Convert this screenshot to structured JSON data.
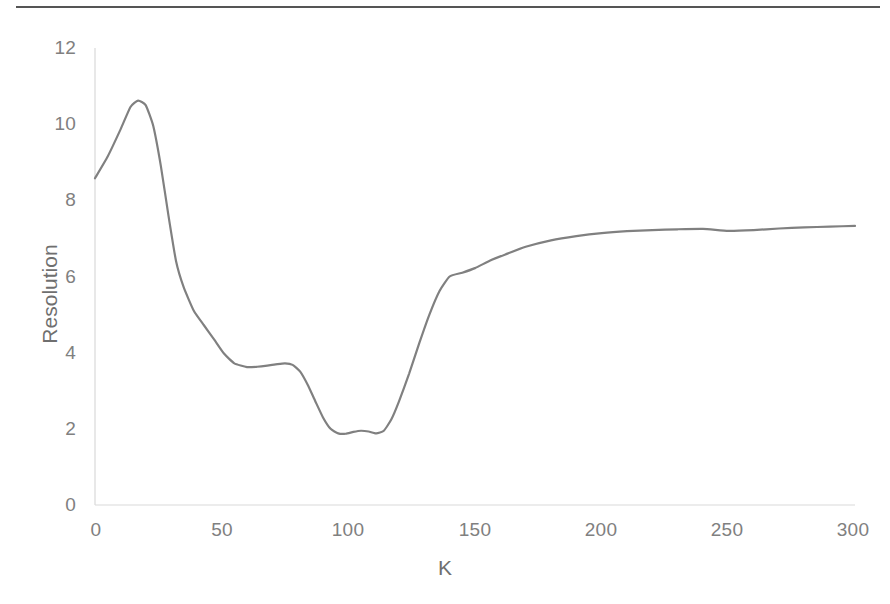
{
  "figure": {
    "background_color": "#ffffff",
    "top_rule_color": "#555555"
  },
  "chart_data": {
    "type": "line",
    "title": "",
    "subtitle": "",
    "xlabel": "K",
    "ylabel": "Resolution",
    "xlim": [
      0,
      300
    ],
    "ylim": [
      0,
      12
    ],
    "xticks": [
      0,
      50,
      100,
      150,
      200,
      250,
      300
    ],
    "yticks": [
      0,
      2,
      4,
      6,
      8,
      10,
      12
    ],
    "xtick_labels": [
      "0",
      "50",
      "100",
      "150",
      "200",
      "250",
      "300"
    ],
    "ytick_labels": [
      "0",
      "2",
      "4",
      "6",
      "8",
      "10",
      "12"
    ],
    "grid": false,
    "legend": false,
    "legend_position": "none",
    "line_color": "#808080",
    "line_width": 2.2,
    "axis_color": "#d9d9d9",
    "tick_label_color": "#808080",
    "series": [
      {
        "name": "Resolution",
        "x": [
          0,
          5,
          10,
          14,
          17,
          20,
          23,
          26,
          29,
          32,
          35,
          39,
          43,
          47,
          51,
          55,
          60,
          64,
          68,
          72,
          75,
          78,
          81,
          84,
          87,
          90,
          93,
          96,
          99,
          102,
          105,
          108,
          111,
          114,
          117,
          120,
          124,
          128,
          132,
          136,
          140,
          145,
          150,
          156,
          162,
          170,
          180,
          190,
          200,
          210,
          220,
          230,
          240,
          250,
          260,
          270,
          280,
          290,
          300
        ],
        "y": [
          8.58,
          9.15,
          9.85,
          10.45,
          10.62,
          10.5,
          9.95,
          8.9,
          7.6,
          6.4,
          5.72,
          5.1,
          4.72,
          4.35,
          3.97,
          3.72,
          3.62,
          3.63,
          3.66,
          3.7,
          3.72,
          3.68,
          3.5,
          3.15,
          2.72,
          2.3,
          2.0,
          1.88,
          1.87,
          1.92,
          1.95,
          1.93,
          1.88,
          1.95,
          2.25,
          2.72,
          3.45,
          4.25,
          5.0,
          5.62,
          6.0,
          6.1,
          6.22,
          6.42,
          6.58,
          6.78,
          6.95,
          7.06,
          7.14,
          7.19,
          7.22,
          7.24,
          7.25,
          7.2,
          7.22,
          7.26,
          7.29,
          7.31,
          7.33
        ]
      }
    ]
  }
}
